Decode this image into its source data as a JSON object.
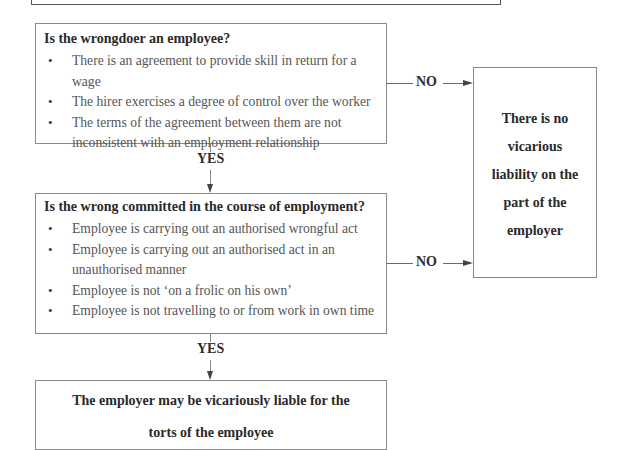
{
  "diagram": {
    "type": "flowchart",
    "box1": {
      "title": "Is the wrongdoer an employee?",
      "bullets": [
        "There is an agreement to provide skill in return for a wage",
        "The hirer exercises a degree of control over the worker",
        "The terms of the agreement between them are not inconsistent with an employment relationship"
      ]
    },
    "box2": {
      "title": "Is the wrong committed in the course of employment?",
      "bullets": [
        "Employee is carrying out an authorised wrongful act",
        "Employee is carrying out an authorised act in an unauthorised manner",
        "Employee is not ‘on a frolic on his own’",
        "Employee is not travelling to or from work in own time"
      ]
    },
    "box3": {
      "line1": "The employer may be vicariously liable for the",
      "line2": "torts of the employee"
    },
    "outcome_no": {
      "lines": [
        "There is no",
        "vicarious",
        "liability on the",
        "part of the",
        "employer"
      ]
    },
    "labels": {
      "yes1": "YES",
      "yes2": "YES",
      "no1": "NO",
      "no2": "NO"
    },
    "colors": {
      "border": "#8a8a8a",
      "text": "#3a3a3a",
      "background": "#ffffff"
    }
  }
}
